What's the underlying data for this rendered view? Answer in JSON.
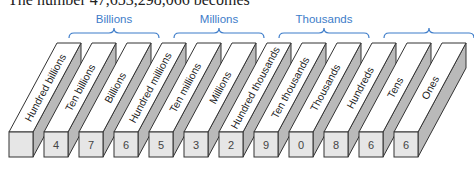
{
  "caption": "The number 47,653,298,066 becomes",
  "groups": [
    {
      "label": "Billions",
      "from": 1,
      "to": 3
    },
    {
      "label": "Millions",
      "from": 4,
      "to": 6
    },
    {
      "label": "Thousands",
      "from": 7,
      "to": 9
    },
    {
      "label": "",
      "from": 10,
      "to": 12
    }
  ],
  "places": [
    {
      "label": "Hundred billions",
      "digit": ""
    },
    {
      "label": "Ten billions",
      "digit": "4"
    },
    {
      "label": "Billions",
      "digit": "7"
    },
    {
      "label": "Hundred millions",
      "digit": "6"
    },
    {
      "label": "Ten millions",
      "digit": "5"
    },
    {
      "label": "Millions",
      "digit": "3"
    },
    {
      "label": "Hundred thousands",
      "digit": "2"
    },
    {
      "label": "Ten thousands",
      "digit": "9"
    },
    {
      "label": "Thousands",
      "digit": "0"
    },
    {
      "label": "Hundreds",
      "digit": "8"
    },
    {
      "label": "Tens",
      "digit": "6"
    },
    {
      "label": "Ones",
      "digit": "6"
    }
  ],
  "colors": {
    "bracket": "#3d7cc9",
    "front": "#e6e6e6",
    "side": "#b9b9b9",
    "top": "#ffffff",
    "stroke": "#333333"
  }
}
